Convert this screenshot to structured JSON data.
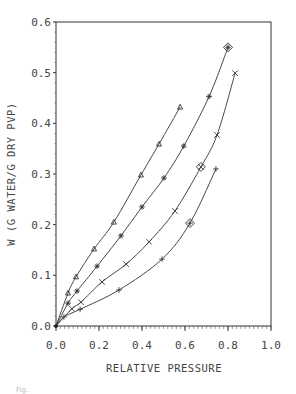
{
  "chart_data": {
    "type": "line",
    "title": "",
    "xlabel": "RELATIVE PRESSURE",
    "ylabel": "W (G WATER/G DRY PVP)",
    "xlim": [
      0.0,
      1.0
    ],
    "ylim": [
      0.0,
      0.6
    ],
    "x_ticks": [
      "0.0",
      "0.2",
      "0.4",
      "0.6",
      "0.8",
      "1.0"
    ],
    "y_ticks": [
      "0.0",
      "0.1",
      "0.2",
      "0.3",
      "0.4",
      "0.5",
      "0.6"
    ],
    "grid": false,
    "legend": "none",
    "series": [
      {
        "name": "triangle",
        "marker": "triangle",
        "x": [
          0.0,
          0.056,
          0.093,
          0.177,
          0.269,
          0.395,
          0.479,
          0.577
        ],
        "y": [
          0.0,
          0.065,
          0.097,
          0.152,
          0.205,
          0.298,
          0.359,
          0.432
        ]
      },
      {
        "name": "star",
        "marker": "star",
        "x": [
          0.0,
          0.056,
          0.098,
          0.191,
          0.302,
          0.4,
          0.502,
          0.594,
          0.712,
          0.8
        ],
        "y": [
          0.0,
          0.045,
          0.069,
          0.118,
          0.178,
          0.235,
          0.292,
          0.355,
          0.453,
          0.55
        ]
      },
      {
        "name": "cross",
        "marker": "x",
        "x": [
          0.0,
          0.074,
          0.116,
          0.214,
          0.326,
          0.433,
          0.553,
          0.674,
          0.749,
          0.833
        ],
        "y": [
          0.0,
          0.034,
          0.047,
          0.087,
          0.122,
          0.166,
          0.227,
          0.314,
          0.377,
          0.499
        ]
      },
      {
        "name": "plus",
        "marker": "plus",
        "x": [
          0.0,
          0.037,
          0.112,
          0.293,
          0.493,
          0.623,
          0.744
        ],
        "y": [
          0.0,
          0.018,
          0.033,
          0.071,
          0.132,
          0.203,
          0.31
        ]
      }
    ],
    "annotations": [
      {
        "type": "diamond",
        "x": 0.8,
        "y": 0.55,
        "series": "star"
      },
      {
        "type": "diamond",
        "x": 0.674,
        "y": 0.314,
        "series": "cross"
      },
      {
        "type": "diamond",
        "x": 0.623,
        "y": 0.203,
        "series": "plus"
      }
    ]
  },
  "caption": "Fig."
}
